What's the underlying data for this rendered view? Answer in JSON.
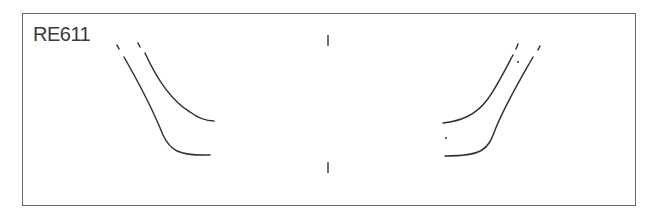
{
  "diagram": {
    "label": "RE611",
    "stroke_color": "#333333",
    "frame_color": "#6a6a6a",
    "center_marks": [
      {
        "x": 328,
        "y1": 35,
        "y2": 46
      },
      {
        "x": 328,
        "y1": 162,
        "y2": 173
      }
    ],
    "left_curves": [
      {
        "name": "outer",
        "path": "M 124 57 C 140 85, 155 115, 163 135 C 170 150, 178 156, 210 155"
      },
      {
        "name": "inner",
        "path": "M 145 53 C 155 75, 170 100, 190 112 C 198 118, 206 121, 214 121"
      },
      {
        "name": "outer-tick",
        "path": "M 117 45 L 119 49"
      },
      {
        "name": "inner-tick",
        "path": "M 138 43 L 140 47"
      }
    ],
    "right_curves": [
      {
        "name": "inner",
        "path": "M 513 55 C 505 70, 495 90, 487 100 C 475 116, 460 121, 443 123"
      },
      {
        "name": "outer",
        "path": "M 533 57 C 520 80, 505 105, 495 130 C 488 150, 482 156, 445 156"
      },
      {
        "name": "inner-tick",
        "path": "M 518 44 L 516 49"
      },
      {
        "name": "outer-tick",
        "path": "M 540 46 L 538 50"
      }
    ],
    "dots": [
      {
        "x": 518,
        "y": 62
      },
      {
        "x": 446,
        "y": 138
      }
    ]
  }
}
